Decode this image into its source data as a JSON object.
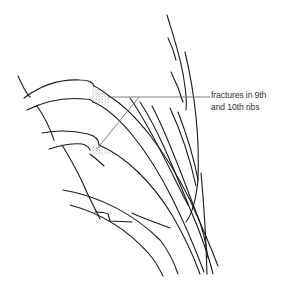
{
  "figure": {
    "type": "anatomical line drawing",
    "annotation": {
      "line1": "fractures in 9th",
      "line2": "and 10th ribs"
    },
    "colors": {
      "line": "#1a1a1a",
      "pointer": "#6e6e6e",
      "stipple": "#555555",
      "background": "#ffffff"
    }
  }
}
